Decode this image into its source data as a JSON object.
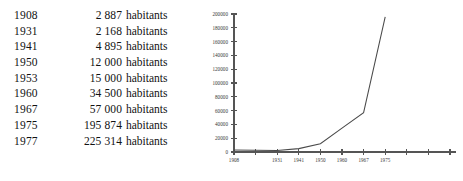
{
  "table": {
    "unit_label": "habitants",
    "rows": [
      {
        "year": "1908",
        "count": "2 887"
      },
      {
        "year": "1931",
        "count": "2 168"
      },
      {
        "year": "1941",
        "count": "4 895"
      },
      {
        "year": "1950",
        "count": "12 000"
      },
      {
        "year": "1953",
        "count": "15 000"
      },
      {
        "year": "1960",
        "count": "34 500"
      },
      {
        "year": "1967",
        "count": "57 000"
      },
      {
        "year": "1975",
        "count": "195 874"
      },
      {
        "year": "1977",
        "count": "225 314"
      }
    ]
  },
  "chart_data": {
    "type": "line",
    "title": "",
    "xlabel": "",
    "ylabel": "",
    "grid": false,
    "legend": "none",
    "line_color": "#4a4a4a",
    "axis_color": "#555555",
    "x": [
      "1908",
      "1931",
      "1941",
      "1950",
      "1960",
      "1967",
      "1975"
    ],
    "categories": [
      "1908",
      "1931",
      "1941",
      "1950",
      "1960",
      "1967",
      "1975"
    ],
    "values": [
      2887,
      2168,
      4895,
      12000,
      34500,
      57000,
      195874
    ],
    "series": [
      {
        "name": "habitants",
        "values": [
          2887,
          2168,
          4895,
          12000,
          34500,
          57000,
          195874
        ]
      }
    ],
    "ylim": [
      0,
      200000
    ],
    "ytick_step": 20000,
    "yticks": [
      0,
      20000,
      40000,
      60000,
      80000,
      100000,
      120000,
      140000,
      160000,
      180000,
      200000
    ],
    "ytick_labels": [
      "0",
      "20000",
      "40000",
      "60000",
      "80000",
      "100000",
      "120000",
      "140000",
      "160000",
      "180000",
      "200000"
    ],
    "xtick_labels": [
      "1908",
      "",
      "1931",
      "1941",
      "1950",
      "1960",
      "1967",
      "1975",
      "",
      "",
      ""
    ],
    "xtick_count": 11
  }
}
